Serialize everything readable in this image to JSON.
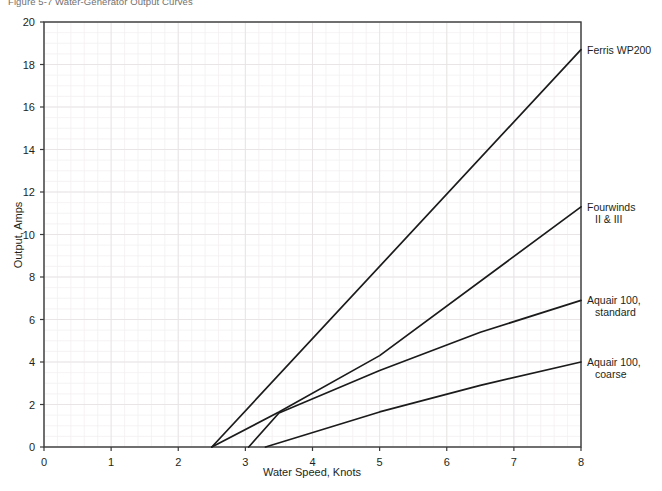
{
  "figure": {
    "caption": "Figure 5-7   Water-Generator Output Curves"
  },
  "chart_data": {
    "type": "line",
    "title": "",
    "xlabel": "Water Speed, Knots",
    "ylabel": "Output, Amps",
    "xlim": [
      0,
      8
    ],
    "ylim": [
      0,
      20
    ],
    "xticks": [
      0,
      1,
      2,
      3,
      4,
      5,
      6,
      7,
      8
    ],
    "yticks": [
      0,
      2,
      4,
      6,
      8,
      10,
      12,
      14,
      16,
      18,
      20
    ],
    "xtick_labels": [
      "0",
      "1",
      "2",
      "3",
      "4",
      "5",
      "6",
      "7",
      "8"
    ],
    "ytick_labels": [
      "0",
      "2",
      "4",
      "6",
      "8",
      "10",
      "12",
      "14",
      "16",
      "18",
      "20"
    ],
    "grid": true,
    "grid_minor": true,
    "legend_position": "right-of-line-ends",
    "line_color": "#1b1b1b",
    "series": [
      {
        "name": "Ferris WP200",
        "label_lines": [
          "Ferris WP200"
        ],
        "label_x": 8.0,
        "label_y": 18.7,
        "x": [
          2.5,
          8.0
        ],
        "y": [
          0.0,
          18.7
        ]
      },
      {
        "name": "Fourwinds II & III",
        "label_lines": [
          "Fourwinds",
          "II & III"
        ],
        "label_x": 8.0,
        "label_y": 11.3,
        "x": [
          2.5,
          3.5,
          5.0,
          8.0
        ],
        "y": [
          0.0,
          1.65,
          4.3,
          11.3
        ]
      },
      {
        "name": "Aquair 100, standard",
        "label_lines": [
          "Aquair 100,",
          "standard"
        ],
        "label_x": 8.0,
        "label_y": 6.9,
        "x": [
          3.05,
          3.5,
          5.0,
          6.5,
          8.0
        ],
        "y": [
          0.0,
          1.6,
          3.6,
          5.4,
          6.9
        ]
      },
      {
        "name": "Aquair 100, coarse",
        "label_lines": [
          "Aquair 100,",
          "coarse"
        ],
        "label_x": 8.0,
        "label_y": 4.0,
        "x": [
          3.3,
          5.0,
          6.5,
          8.0
        ],
        "y": [
          0.0,
          1.65,
          2.9,
          4.0
        ]
      }
    ]
  }
}
